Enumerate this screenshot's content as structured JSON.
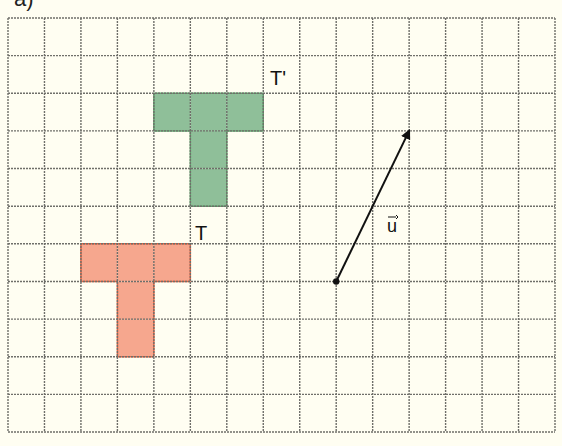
{
  "figure": {
    "caption": "a)",
    "background_color": "#fffef2",
    "grid": {
      "columns": 15,
      "rows": 11,
      "left": 8,
      "top": 18,
      "right": 555,
      "bottom": 432,
      "line_color": "#6f6f6a",
      "line_style": "dashed"
    },
    "shapes": [
      {
        "name": "T",
        "label": "T",
        "fill": "#f6a78e",
        "stroke": "#e8613f",
        "cells": [
          [
            2,
            6
          ],
          [
            3,
            6
          ],
          [
            4,
            6
          ],
          [
            3,
            7
          ],
          [
            3,
            8
          ]
        ],
        "label_pos": [
          195,
          240
        ]
      },
      {
        "name": "T-prime",
        "label": "T'",
        "fill": "#8fbf99",
        "stroke": "#5fa36c",
        "cells": [
          [
            4,
            2
          ],
          [
            5,
            2
          ],
          [
            6,
            2
          ],
          [
            5,
            3
          ],
          [
            5,
            4
          ]
        ],
        "label_pos": [
          270,
          85
        ]
      }
    ],
    "vector": {
      "label": "u",
      "start_cell": [
        9,
        7
      ],
      "end_cell": [
        11,
        3
      ],
      "color": "#111111",
      "label_pos": [
        387,
        232
      ]
    }
  }
}
